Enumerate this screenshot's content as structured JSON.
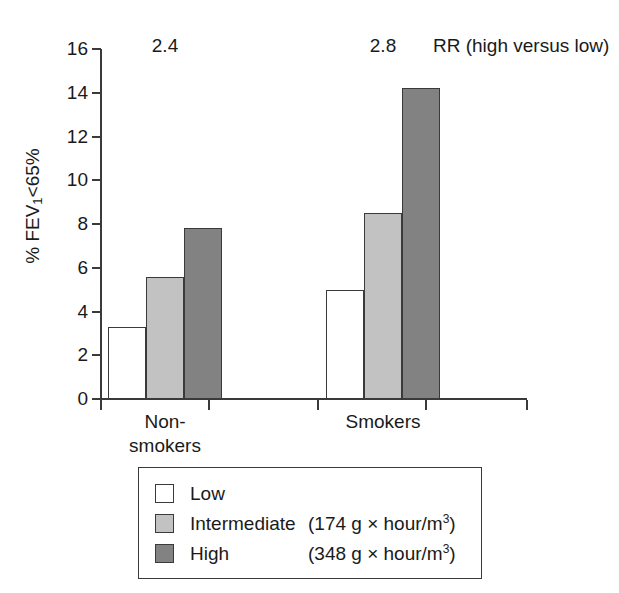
{
  "chart_data": {
    "type": "bar",
    "title": "",
    "xlabel": "",
    "ylabel": "% FEV1<65%",
    "ylim": [
      0,
      16
    ],
    "ytick_step": 2,
    "yticks": [
      "16",
      "14",
      "12",
      "10",
      "8",
      "6",
      "4",
      "2",
      "0"
    ],
    "categories": [
      "Non-smokers",
      "Smokers"
    ],
    "category_label_lines": [
      [
        "Non-",
        "smokers"
      ],
      [
        "Smokers"
      ]
    ],
    "grid": false,
    "legend_position": "bottom-center",
    "series": [
      {
        "name": "Low",
        "values": [
          3.3,
          5.0
        ],
        "color": "#ffffff"
      },
      {
        "name": "Intermediate",
        "values": [
          5.6,
          8.5
        ],
        "color": "#c2c2c2"
      },
      {
        "name": "High",
        "values": [
          7.8,
          14.2
        ],
        "color": "#828282"
      }
    ],
    "annotations": {
      "caption": "RR (high versus low)",
      "values": [
        "2.4",
        "2.8"
      ]
    }
  },
  "legend": {
    "items": [
      {
        "name": "Low",
        "units": ""
      },
      {
        "name": "Intermediate",
        "units": "(174 g × hour/m",
        "exponent": "3",
        "units_close": ")"
      },
      {
        "name": "High",
        "units": "(348 g × hour/m",
        "exponent": "3",
        "units_close": ")"
      }
    ]
  },
  "axis": {
    "y_title_prefix": "% FEV",
    "y_title_sub": "1",
    "y_title_suffix": "<65%"
  }
}
